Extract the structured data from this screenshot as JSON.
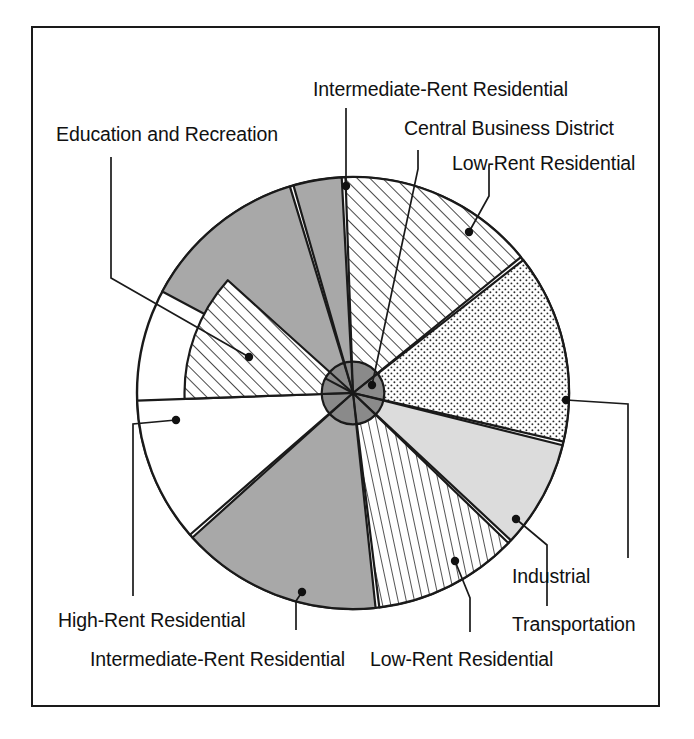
{
  "figure": {
    "frame_color": "#1a1a1a",
    "background": "#ffffff"
  },
  "chart_data": {
    "type": "pie",
    "xlabel": "",
    "ylabel": "",
    "grid": false,
    "legend_position": "callout-labels",
    "center_label": "Central Business District",
    "categories": [
      "Central Business District",
      "Low-Rent Residential",
      "Industrial",
      "Transportation",
      "Low-Rent Residential",
      "Intermediate-Rent Residential",
      "High-Rent Residential",
      "Education and Recreation",
      "Intermediate-Rent Residential"
    ],
    "values": [
      4,
      13,
      17,
      10,
      13,
      17,
      13,
      13,
      13
    ],
    "sectors": [
      {
        "id": "core",
        "name": "Central Business District",
        "fill": "dark-gray",
        "hex": "#8a8a8a",
        "start_deg": 0,
        "end_deg": 360,
        "radius_frac": 0.145,
        "note": "central core circle"
      },
      {
        "id": "cbd-wedge",
        "name": "Central Business District",
        "fill": "medium-gray",
        "hex": "#a8a8a8",
        "start_deg": -16,
        "end_deg": -3,
        "radius_frac": 1.0
      },
      {
        "id": "irr-top",
        "name": "Intermediate-Rent Residential",
        "fill": "medium-gray",
        "hex": "#a8a8a8",
        "start_deg": -62,
        "end_deg": -17,
        "radius_frac": 1.0
      },
      {
        "id": "lrr-upper",
        "name": "Low-Rent Residential",
        "fill": "diagonal-hatch-right",
        "hex": "#ffffff",
        "start_deg": -2,
        "end_deg": 51,
        "radius_frac": 1.0
      },
      {
        "id": "industrial",
        "name": "Industrial",
        "fill": "stipple-dots",
        "hex": "#ffffff",
        "start_deg": 52,
        "end_deg": 103,
        "radius_frac": 1.0
      },
      {
        "id": "transportation",
        "name": "Transportation",
        "fill": "light-gray",
        "hex": "#dcdcdc",
        "start_deg": 104,
        "end_deg": 133,
        "radius_frac": 1.0
      },
      {
        "id": "lrr-lower",
        "name": "Low-Rent Residential",
        "fill": "vertical-hatch",
        "hex": "#ffffff",
        "start_deg": 134,
        "end_deg": 173,
        "radius_frac": 1.0
      },
      {
        "id": "irr-bottom",
        "name": "Intermediate-Rent Residential",
        "fill": "medium-gray",
        "hex": "#a8a8a8",
        "start_deg": 174,
        "end_deg": 228,
        "radius_frac": 1.0
      },
      {
        "id": "hrr",
        "name": "High-Rent Residential",
        "fill": "white",
        "hex": "#ffffff",
        "start_deg": 229,
        "end_deg": 268,
        "radius_frac": 1.0
      },
      {
        "id": "edrec",
        "name": "Education and Recreation",
        "fill": "diagonal-hatch-right",
        "hex": "#ffffff",
        "start_deg": 268,
        "end_deg": 312,
        "radius_frac": 0.78
      }
    ]
  },
  "labels": [
    {
      "id": "intermediate-rent-residential-top",
      "text": "Intermediate-Rent Residential"
    },
    {
      "id": "central-business-district",
      "text": "Central Business District"
    },
    {
      "id": "low-rent-residential-upper",
      "text": "Low-Rent Residential"
    },
    {
      "id": "education-and-recreation",
      "text": "Education and Recreation"
    },
    {
      "id": "industrial",
      "text": "Industrial"
    },
    {
      "id": "transportation",
      "text": "Transportation"
    },
    {
      "id": "low-rent-residential-lower",
      "text": "Low-Rent Residential"
    },
    {
      "id": "high-rent-residential",
      "text": "High-Rent Residential"
    },
    {
      "id": "intermediate-rent-residential-bottom",
      "text": "Intermediate-Rent Residential"
    }
  ]
}
